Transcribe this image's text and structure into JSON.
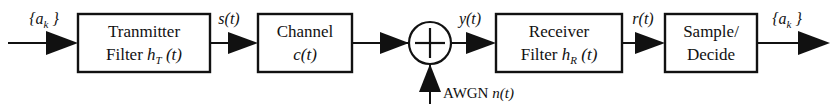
{
  "diagram": {
    "background_color": "#ffffff",
    "line_color": "#111111",
    "blocks": [
      {
        "id": "transmitter-filter",
        "line1": "Tranmitter",
        "line2_plain": "Filter ",
        "line2_sym": "h",
        "line2_sub": "T",
        "line2_arg": " (t)",
        "x": 78,
        "y": 14,
        "w": 132,
        "h": 58
      },
      {
        "id": "channel",
        "line1": "Channel",
        "line2_sym": "c(t)",
        "x": 258,
        "y": 14,
        "w": 94,
        "h": 58
      },
      {
        "id": "receiver-filter",
        "line1": "Receiver",
        "line2_plain": "Filter ",
        "line2_sym": "h",
        "line2_sub": "R",
        "line2_arg": " (t)",
        "x": 496,
        "y": 14,
        "w": 126,
        "h": 58
      },
      {
        "id": "sample-decide",
        "line1": "Sample/",
        "line2": "Decide",
        "x": 665,
        "y": 14,
        "w": 92,
        "h": 58
      }
    ],
    "summing_junction": {
      "id": "summing-junction",
      "cx": 430,
      "cy": 43,
      "r": 21,
      "operator": "+"
    },
    "signals": [
      {
        "id": "input-symbols",
        "sym": "a",
        "sub": "k",
        "braces": true,
        "text": "{a_k }",
        "x": 44,
        "y": 24
      },
      {
        "id": "transmit-signal",
        "text": "s(t)",
        "x": 229,
        "y": 24
      },
      {
        "id": "received-signal",
        "text": "y(t)",
        "x": 470,
        "y": 24
      },
      {
        "id": "filtered-signal",
        "text": "r(t)",
        "x": 643,
        "y": 24
      },
      {
        "id": "output-symbols",
        "sym": "a",
        "sub": "k",
        "braces": true,
        "text": "{a_k }",
        "x": 787,
        "y": 24
      }
    ],
    "noise": {
      "id": "awgn-source",
      "label_plain": "AWGN ",
      "label_italic": "n(t)",
      "x": 443,
      "y": 98
    }
  }
}
